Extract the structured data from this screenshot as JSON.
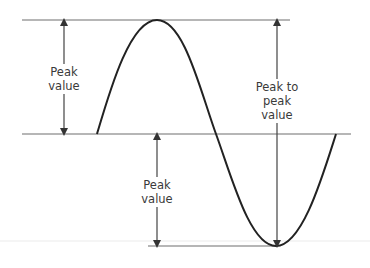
{
  "diagram": {
    "type": "sine-wave-amplitude",
    "colors": {
      "curve": "#222222",
      "reference_lines": "#6e6e6e",
      "arrows": "#444444",
      "text": "#3a3a3a"
    },
    "reference_lines": [
      {
        "name": "positive-peak-line",
        "y": 20,
        "x1": 22,
        "x2": 290
      },
      {
        "name": "zero-line",
        "y": 134,
        "x1": 22,
        "x2": 351
      },
      {
        "name": "negative-peak-line",
        "y": 246,
        "x1": 148,
        "x2": 277
      }
    ],
    "labels": {
      "left_peak": [
        "Peak",
        "value"
      ],
      "peak_to_peak": [
        "Peak to",
        "peak",
        "value"
      ],
      "lower_peak": [
        "Peak",
        "value"
      ]
    }
  }
}
